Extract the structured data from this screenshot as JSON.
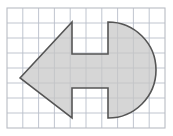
{
  "figure": {
    "title": "",
    "canvas": {
      "width": 173,
      "height": 136,
      "background_color": "#ffffff"
    },
    "frame": {
      "x": 7,
      "y": 8,
      "width": 158,
      "height": 120,
      "border_color": "#b9bcc4",
      "border_width": 1,
      "fill_color": "#ffffff"
    },
    "grid": {
      "visible": true,
      "columns": 10,
      "rows": 8,
      "cell_width": 15.8,
      "cell_height": 15.0,
      "line_color": "#b9bec9",
      "line_width": 0.9
    },
    "shape": {
      "name": "arrow-circle-notched-polygon",
      "fill_color": "#c6c6c6",
      "fill_opacity": 0.72,
      "stroke_color": "#555555",
      "stroke_width": 1.6,
      "arrow_tip": {
        "x": 20,
        "y": 78
      },
      "upper_vertex": {
        "x": 72,
        "y": 22
      },
      "lower_vertex": {
        "x": 72,
        "y": 118
      },
      "top_notch": {
        "x1": 72,
        "x2": 108,
        "y_top": 22,
        "y_bottom": 54
      },
      "bottom_notch": {
        "x1": 72,
        "x2": 108,
        "y_top": 88,
        "y_bottom": 118
      },
      "circle": {
        "cx": 108,
        "cy": 70,
        "radius": 48
      },
      "path": "M 20 78 L 72 22 L 72 54 L 108 54 L 108 22 A 48 48 0 0 1 108 118 L 108 88 L 72 88 L 72 118 Z"
    }
  }
}
